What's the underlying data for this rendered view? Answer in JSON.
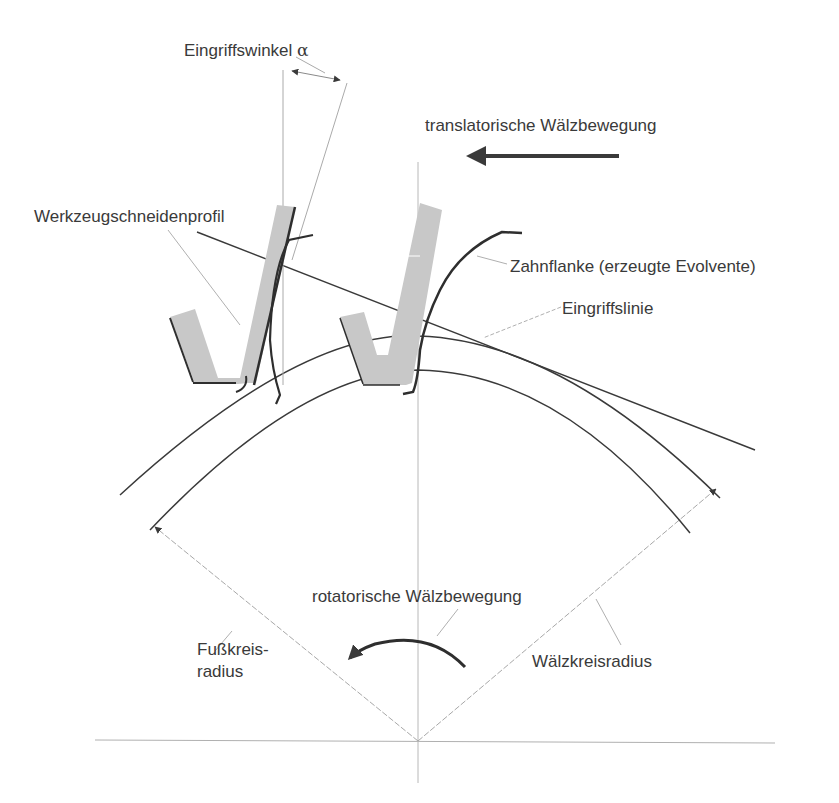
{
  "diagram": {
    "labels": {
      "pressure_angle": "Eingriffswinkel",
      "pressure_angle_symbol": "α",
      "translational_motion": "translatorische Wälzbewegung",
      "tool_profile": "Werkzeugschneidenprofil",
      "tooth_flank": "Zahnflanke (erzeugte Evolvente)",
      "line_of_action": "Eingriffslinie",
      "rotational_motion": "rotatorische Wälzbewegung",
      "root_radius": "Fußkreis-\nradius",
      "pitch_radius": "Wälzkreisradius"
    },
    "colors": {
      "line": "#3a3a3a",
      "thin_line": "#9a9a9a",
      "tool_fill": "#c8c8c8",
      "text": "#3a3a3a",
      "background": "#ffffff"
    }
  }
}
